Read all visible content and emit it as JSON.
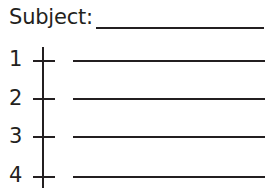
{
  "worksheet": {
    "subject_label": "Subject:",
    "subject_value": "",
    "rows": [
      {
        "number": "1",
        "value": ""
      },
      {
        "number": "2",
        "value": ""
      },
      {
        "number": "3",
        "value": ""
      },
      {
        "number": "4",
        "value": ""
      }
    ]
  }
}
